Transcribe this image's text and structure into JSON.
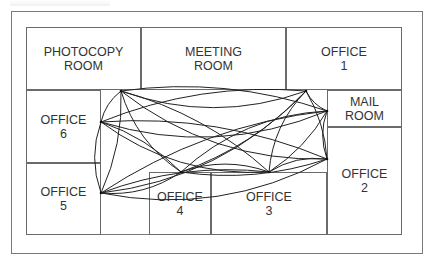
{
  "caption": {
    "note": "Top-edge text is clipped by the image boundary; only the lower edge of the glyphs is visible and it is not legible.",
    "text": null
  },
  "plan": {
    "outer_frame": {
      "x": 11,
      "y": 11,
      "w": 412,
      "h": 243
    },
    "inner_frame": {
      "x": 26,
      "y": 27,
      "w": 376,
      "h": 208
    }
  },
  "rooms": [
    {
      "id": "photocopy",
      "line1": "PHOTOCOPY",
      "line2": "ROOM",
      "x": 26,
      "y": 27,
      "w": 115,
      "h": 63
    },
    {
      "id": "meeting",
      "line1": "MEETING",
      "line2": "ROOM",
      "x": 141,
      "y": 27,
      "w": 145,
      "h": 63
    },
    {
      "id": "office1",
      "line1": "OFFICE",
      "line2": "1",
      "x": 286,
      "y": 27,
      "w": 116,
      "h": 63
    },
    {
      "id": "mailroom",
      "line1": "MAIL",
      "line2": "ROOM",
      "x": 327,
      "y": 90,
      "w": 75,
      "h": 37
    },
    {
      "id": "office2",
      "line1": "OFFICE",
      "line2": "2",
      "x": 327,
      "y": 127,
      "w": 75,
      "h": 108
    },
    {
      "id": "office3",
      "line1": "OFFICE",
      "line2": "3",
      "x": 211,
      "y": 172,
      "w": 116,
      "h": 63
    },
    {
      "id": "office4",
      "line1": "OFFICE",
      "line2": "4",
      "x": 149,
      "y": 172,
      "w": 62,
      "h": 63
    },
    {
      "id": "office5",
      "line1": "OFFICE",
      "line2": "5",
      "x": 26,
      "y": 163,
      "w": 75,
      "h": 72
    },
    {
      "id": "office6",
      "line1": "OFFICE",
      "line2": "6",
      "x": 26,
      "y": 90,
      "w": 75,
      "h": 73
    }
  ],
  "doors": {
    "photocopy": [
      121,
      91
    ],
    "office6": [
      101,
      122
    ],
    "office5": [
      101,
      193
    ],
    "office1": [
      306,
      91
    ],
    "mailroom": [
      327,
      111
    ],
    "office2": [
      327,
      159
    ],
    "office3": [
      269,
      172
    ],
    "office4": [
      181,
      172
    ]
  },
  "connection_style": {
    "stroke": "#222222",
    "width": 1
  }
}
